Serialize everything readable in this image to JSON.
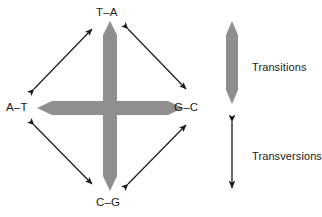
{
  "figure": {
    "type": "diagram",
    "colors": {
      "thick_arrow_gray": "#8f8f8f",
      "thin_arrow_black": "#1a1a1a",
      "text": "#1a1a1a",
      "background": "#ffffff"
    },
    "nodes": [
      {
        "id": "top",
        "label": "T–A"
      },
      {
        "id": "left",
        "label": "A–T"
      },
      {
        "id": "right",
        "label": "G–C"
      },
      {
        "id": "bottom",
        "label": "C–G"
      }
    ],
    "connections": [
      {
        "from": "top",
        "to": "bottom",
        "style": "thick-gray-double-arrow",
        "meaning": "Transitions"
      },
      {
        "from": "left",
        "to": "right",
        "style": "thick-gray-double-arrow",
        "meaning": "Transitions"
      },
      {
        "from": "left",
        "to": "top",
        "style": "thin-black-double-arrow",
        "meaning": "Transversions"
      },
      {
        "from": "top",
        "to": "right",
        "style": "thin-black-double-arrow",
        "meaning": "Transversions"
      },
      {
        "from": "left",
        "to": "bottom",
        "style": "thin-black-double-arrow",
        "meaning": "Transversions"
      },
      {
        "from": "bottom",
        "to": "right",
        "style": "thin-black-double-arrow",
        "meaning": "Transversions"
      }
    ],
    "legend": {
      "items": [
        {
          "id": "transitions",
          "label": "Transitions",
          "swatch": "thick-gray-double-arrow"
        },
        {
          "id": "transversions",
          "label": "Transversions",
          "swatch": "thin-black-double-arrow"
        }
      ]
    }
  }
}
